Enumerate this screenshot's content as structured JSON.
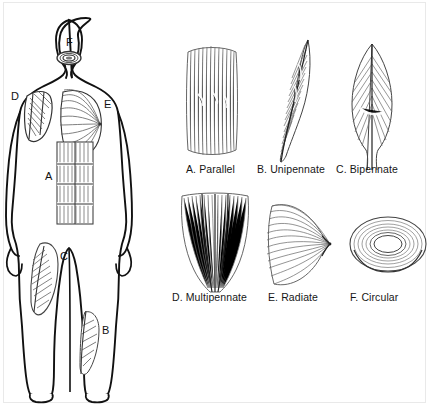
{
  "diagram": {
    "colors": {
      "outline": "#111111",
      "fiber": "#5a5a5a",
      "fiber_light": "#8c8c8c",
      "background": "#ffffff",
      "border": "#e9e9e9"
    }
  },
  "body_figure": {
    "name": "human-body-anterior-view",
    "keys": [
      {
        "id": "F",
        "letter": "F",
        "muscle_type": "Circular",
        "region": "face-mouth"
      },
      {
        "id": "D",
        "letter": "D",
        "muscle_type": "Multipennate",
        "region": "shoulder-deltoid"
      },
      {
        "id": "E",
        "letter": "E",
        "muscle_type": "Radiate",
        "region": "chest-pectoralis"
      },
      {
        "id": "A",
        "letter": "A",
        "muscle_type": "Parallel",
        "region": "abdomen-rectus-abdominis"
      },
      {
        "id": "C",
        "letter": "C",
        "muscle_type": "Bipennate",
        "region": "thigh-rectus-femoris"
      },
      {
        "id": "B",
        "letter": "B",
        "muscle_type": "Unipennate",
        "region": "lower-leg"
      }
    ]
  },
  "types": [
    {
      "key": "A",
      "label": "A. Parallel",
      "shape": "long-straight-fascicles"
    },
    {
      "key": "B",
      "label": "B. Unipennate",
      "shape": "oblique-fascicles-one-side"
    },
    {
      "key": "C",
      "label": "C. Bipennate",
      "shape": "fascicles-both-sides-central-tendon"
    },
    {
      "key": "D",
      "label": "D. Multipennate",
      "shape": "multiple-tendon-convergence"
    },
    {
      "key": "E",
      "label": "E. Radiate",
      "shape": "fan-converging-to-tendon"
    },
    {
      "key": "F",
      "label": "F. Circular",
      "shape": "concentric-rings"
    }
  ]
}
